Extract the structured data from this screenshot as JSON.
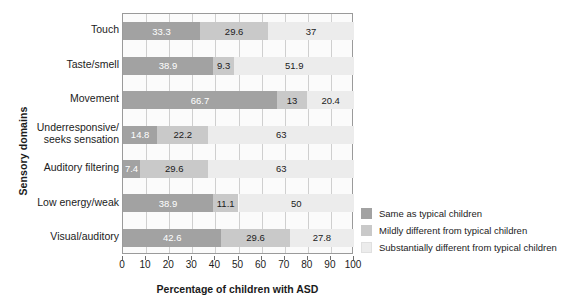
{
  "chart_data": {
    "type": "bar",
    "orientation": "horizontal",
    "stacked": true,
    "title": "",
    "xlabel": "Percentage of children with ASD",
    "ylabel": "Sensory domains",
    "xlim": [
      0,
      100
    ],
    "xticks": [
      0,
      10,
      20,
      30,
      40,
      50,
      60,
      70,
      80,
      90,
      100
    ],
    "grid": true,
    "legend_position": "right",
    "categories": [
      "Touch",
      "Taste/smell",
      "Movement",
      "Underresponsive/ seeks sensation",
      "Auditory filtering",
      "Low energy/weak",
      "Visual/auditory"
    ],
    "category_lines": [
      [
        "Touch"
      ],
      [
        "Taste/smell"
      ],
      [
        "Movement"
      ],
      [
        "Underresponsive/",
        "seeks sensation"
      ],
      [
        "Auditory filtering"
      ],
      [
        "Low energy/weak"
      ],
      [
        "Visual/auditory"
      ]
    ],
    "series": [
      {
        "name": "Same as typical children",
        "color": "#a2a2a2",
        "values": [
          33.3,
          38.9,
          66.7,
          14.8,
          7.4,
          38.9,
          42.6
        ],
        "labels": [
          "33.3",
          "38.9",
          "66.7",
          "14.8",
          "7.4",
          "38.9",
          "42.6"
        ]
      },
      {
        "name": "Mildly different from typical children",
        "color": "#c9c9c9",
        "values": [
          29.6,
          9.3,
          13,
          22.2,
          29.6,
          11.1,
          29.6
        ],
        "labels": [
          "29.6",
          "9.3",
          "13",
          "22.2",
          "29.6",
          "11.1",
          "29.6"
        ]
      },
      {
        "name": "Substantially different from typical children",
        "color": "#ececec",
        "values": [
          37,
          51.9,
          20.4,
          63,
          63,
          50,
          27.8
        ],
        "labels": [
          "37",
          "51.9",
          "20.4",
          "63",
          "63",
          "50",
          "27.8"
        ]
      }
    ]
  }
}
